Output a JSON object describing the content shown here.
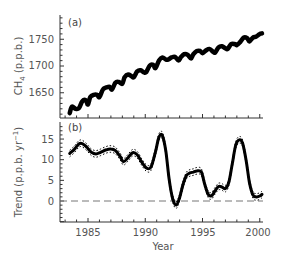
{
  "chart_data": [
    {
      "type": "line",
      "panel_label": "(a)",
      "title": "",
      "xlabel": "",
      "ylabel": "CH4 (p.p.b.)",
      "ylabel_main": "CH",
      "ylabel_sub": "4",
      "ylabel_rest": " (p.p.b.)",
      "yticks": [
        1650,
        1700,
        1750
      ],
      "ylim": [
        1605,
        1795
      ],
      "xlim": [
        1982.6,
        2000.5
      ],
      "grid": false,
      "legend": "none",
      "series": [
        {
          "name": "CH4 (seasonal)",
          "x": [
            1983.4,
            1983.6,
            1983.9,
            1984.2,
            1984.5,
            1984.8,
            1985.0,
            1985.2,
            1985.5,
            1985.8,
            1986.0,
            1986.3,
            1986.6,
            1986.9,
            1987.1,
            1987.4,
            1987.7,
            1988.0,
            1988.2,
            1988.5,
            1988.8,
            1989.0,
            1989.3,
            1989.6,
            1989.9,
            1990.1,
            1990.4,
            1990.7,
            1990.9,
            1991.2,
            1991.5,
            1991.8,
            1992.0,
            1992.3,
            1992.6,
            1992.9,
            1993.1,
            1993.4,
            1993.7,
            1994.0,
            1994.2,
            1994.5,
            1994.8,
            1995.0,
            1995.3,
            1995.6,
            1995.9,
            1996.1,
            1996.4,
            1996.7,
            1997.0,
            1997.2,
            1997.5,
            1997.8,
            1998.0,
            1998.3,
            1998.6,
            1998.9,
            1999.1,
            1999.4,
            1999.7,
            2000.0,
            2000.2
          ],
          "values": [
            1612,
            1624,
            1620,
            1621,
            1634,
            1636,
            1628,
            1642,
            1646,
            1646,
            1642,
            1656,
            1660,
            1661,
            1656,
            1669,
            1670,
            1667,
            1679,
            1684,
            1681,
            1679,
            1690,
            1692,
            1688,
            1689,
            1701,
            1702,
            1696,
            1710,
            1716,
            1712,
            1712,
            1716,
            1717,
            1710,
            1716,
            1722,
            1721,
            1714,
            1722,
            1728,
            1728,
            1724,
            1729,
            1732,
            1727,
            1725,
            1735,
            1737,
            1733,
            1732,
            1741,
            1741,
            1739,
            1745,
            1753,
            1752,
            1746,
            1753,
            1755,
            1760,
            1761
          ]
        }
      ]
    },
    {
      "type": "line",
      "panel_label": "(b)",
      "title": "",
      "xlabel": "Year",
      "ylabel": "Trend (p.p.b. yr-1)",
      "ylabel_main": "Trend (p.p.b. yr",
      "ylabel_sup": "-1",
      "ylabel_rest": ")",
      "yticks": [
        0,
        5,
        10,
        15
      ],
      "xticks": [
        1985,
        1990,
        1995,
        2000
      ],
      "ylim": [
        -5,
        19
      ],
      "xlim": [
        1982.6,
        2000.5
      ],
      "grid": false,
      "legend": "none",
      "reference_line": {
        "y": 0,
        "style": "dashed"
      },
      "series": [
        {
          "name": "Growth rate trend",
          "x": [
            1983.4,
            1983.8,
            1984.2,
            1984.5,
            1984.9,
            1985.3,
            1985.7,
            1986.1,
            1986.6,
            1987.0,
            1987.4,
            1987.8,
            1988.1,
            1988.5,
            1988.9,
            1989.3,
            1989.7,
            1990.1,
            1990.5,
            1990.9,
            1991.2,
            1991.5,
            1991.8,
            1992.1,
            1992.4,
            1992.7,
            1993.0,
            1993.3,
            1993.6,
            1993.9,
            1994.2,
            1994.5,
            1994.9,
            1995.2,
            1995.5,
            1995.8,
            1996.1,
            1996.4,
            1996.7,
            1997.0,
            1997.3,
            1997.6,
            1997.9,
            1998.2,
            1998.5,
            1998.8,
            1999.1,
            1999.4,
            1999.7,
            2000.0,
            2000.2
          ],
          "values": [
            11.5,
            12.5,
            13.8,
            13.9,
            13.0,
            11.8,
            11.4,
            11.8,
            12.4,
            12.6,
            12.2,
            10.8,
            9.5,
            10.5,
            11.7,
            11.2,
            9.4,
            8.0,
            8.2,
            12.0,
            15.5,
            15.8,
            12.0,
            5.0,
            0.5,
            -1.0,
            0.8,
            4.0,
            6.2,
            6.8,
            7.0,
            7.3,
            7.0,
            4.0,
            1.6,
            1.3,
            2.5,
            3.5,
            3.4,
            3.0,
            4.5,
            9.0,
            13.5,
            14.8,
            14.0,
            10.0,
            4.5,
            1.5,
            1.0,
            1.2,
            1.6
          ]
        },
        {
          "name": "Uncertainty bounds (dotted)",
          "style": "dotted",
          "upper_offset": 0.8,
          "lower_offset": -0.8
        }
      ]
    }
  ],
  "labels": {
    "panel_a": "(a)",
    "panel_b": "(b)",
    "a_yticks": [
      "1650",
      "1700",
      "1750"
    ],
    "b_yticks": [
      "0",
      "5",
      "10",
      "15"
    ],
    "xticks": [
      "1985",
      "1990",
      "1995",
      "2000"
    ],
    "xlabel": "Year",
    "a_ylabel_main": "CH",
    "a_ylabel_sub": "4",
    "a_ylabel_rest": " (p.p.b.)",
    "b_ylabel_main": "Trend (p.p.b. yr",
    "b_ylabel_sup": "−1",
    "b_ylabel_rest": ")"
  },
  "colors": {
    "line": "#000000",
    "axis": "#333333",
    "text": "#555555",
    "zero_line": "#777777"
  }
}
